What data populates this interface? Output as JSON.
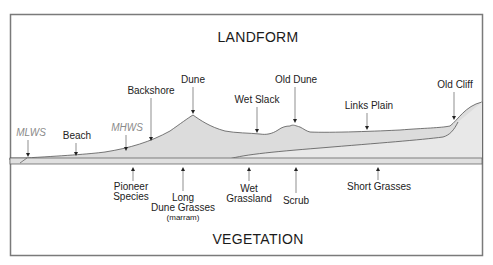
{
  "titles": {
    "top": "LANDFORM",
    "bottom": "VEGETATION"
  },
  "landform_labels": [
    {
      "id": "mlws",
      "lines": [
        "MLWS"
      ],
      "style": "tidal"
    },
    {
      "id": "beach",
      "lines": [
        "Beach"
      ],
      "style": "normal"
    },
    {
      "id": "mhws",
      "lines": [
        "MHWS"
      ],
      "style": "tidal"
    },
    {
      "id": "backshore",
      "lines": [
        "Backshore"
      ],
      "style": "normal"
    },
    {
      "id": "dune",
      "lines": [
        "Dune"
      ],
      "style": "normal"
    },
    {
      "id": "wet-slack",
      "lines": [
        "Wet Slack"
      ],
      "style": "normal"
    },
    {
      "id": "old-dune",
      "lines": [
        "Old Dune"
      ],
      "style": "normal"
    },
    {
      "id": "links-plain",
      "lines": [
        "Links Plain"
      ],
      "style": "normal"
    },
    {
      "id": "old-cliff",
      "lines": [
        "Old Cliff"
      ],
      "style": "normal"
    }
  ],
  "vegetation_labels": [
    {
      "id": "pioneer-species",
      "lines": [
        "Pioneer",
        "Species"
      ]
    },
    {
      "id": "long-dune-grasses",
      "lines": [
        "Long",
        "Dune Grasses"
      ],
      "note": "(marram)"
    },
    {
      "id": "wet-grassland",
      "lines": [
        "Wet",
        "Grassland"
      ]
    },
    {
      "id": "scrub",
      "lines": [
        "Scrub"
      ]
    },
    {
      "id": "short-grasses",
      "lines": [
        "Short Grasses"
      ]
    }
  ],
  "colors": {
    "landform_fill": "#dcdcdc",
    "inner_fill": "#e8e8e8",
    "outline": "#555555",
    "frame": "#7a7a7a",
    "tidal_text": "#8a8a8a"
  }
}
